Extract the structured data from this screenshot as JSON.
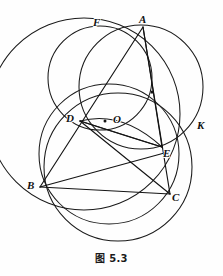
{
  "figure": {
    "caption": "图 5.3",
    "stroke_color": "#1a1a1a",
    "background_color": "#fefefe",
    "labels": [
      {
        "id": "F",
        "text": "F",
        "x": 93,
        "y": 17
      },
      {
        "id": "A",
        "text": "A",
        "x": 139,
        "y": 14
      },
      {
        "id": "D",
        "text": "D",
        "x": 66,
        "y": 113
      },
      {
        "id": "O",
        "text": "O",
        "x": 113,
        "y": 114
      },
      {
        "id": "K",
        "text": "K",
        "x": 197,
        "y": 120
      },
      {
        "id": "E",
        "text": "E",
        "x": 163,
        "y": 148
      },
      {
        "id": "B",
        "text": "B",
        "x": 27,
        "y": 180
      },
      {
        "id": "C",
        "text": "C",
        "x": 172,
        "y": 192
      }
    ],
    "points": [
      {
        "id": "A",
        "x": 143,
        "y": 27
      },
      {
        "id": "F",
        "x": 98,
        "y": 26
      },
      {
        "id": "D",
        "x": 80,
        "y": 121
      },
      {
        "id": "O",
        "x": 109,
        "y": 122
      },
      {
        "id": "E",
        "x": 162,
        "y": 147
      },
      {
        "id": "K",
        "x": 196,
        "y": 131
      },
      {
        "id": "B",
        "x": 40,
        "y": 187
      },
      {
        "id": "C",
        "x": 170,
        "y": 194
      },
      {
        "id": "M",
        "x": 152,
        "y": 92
      }
    ],
    "circles": [
      {
        "id": "big-left-circle",
        "cx": 84,
        "cy": 114,
        "r": 96
      },
      {
        "id": "top-middle-circle",
        "cx": 100,
        "cy": 78,
        "r": 52
      },
      {
        "id": "right-circle",
        "cx": 141,
        "cy": 87,
        "r": 62
      },
      {
        "id": "bottom-circle",
        "cx": 109,
        "cy": 154,
        "r": 70
      },
      {
        "id": "lower-circle",
        "cx": 118,
        "cy": 167,
        "r": 74
      }
    ],
    "arcs": [
      {
        "id": "lens-arc-upper",
        "from": "D",
        "to": "E",
        "sag": -12
      },
      {
        "id": "lens-arc-lower",
        "from": "D",
        "to": "E",
        "sag": 10
      }
    ],
    "segments": [
      {
        "id": "A-D",
        "from": "A",
        "to": "D"
      },
      {
        "id": "D-B",
        "from": "D",
        "to": "B"
      },
      {
        "id": "A-E",
        "from": "A",
        "to": "E"
      },
      {
        "id": "E-C",
        "from": "E",
        "to": "C"
      },
      {
        "id": "B-C",
        "from": "B",
        "to": "C"
      },
      {
        "id": "D-E",
        "from": "D",
        "to": "E"
      },
      {
        "id": "A-M-extend",
        "from": "A",
        "to": "C"
      }
    ],
    "center_marks": [
      {
        "id": "center-dot-O",
        "x": 105,
        "y": 122,
        "r": 1.4
      },
      {
        "id": "center-square-M",
        "x": 152,
        "y": 92,
        "size": 2.6
      }
    ]
  }
}
